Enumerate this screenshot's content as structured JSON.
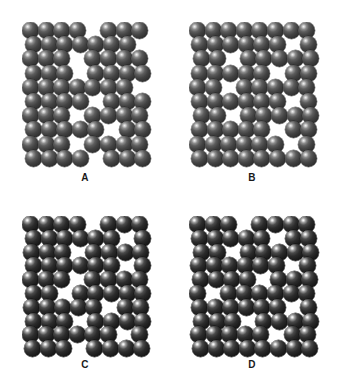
{
  "figure": {
    "background_color": "#ffffff",
    "width": 339,
    "height": 386
  },
  "sphere_style": {
    "gray_body_color": "#434343",
    "gray_shadow_color": "#1d1d1d",
    "dark_body_color": "#2b2b2b",
    "dark_shadow_color": "#0a0a0a",
    "highlight_color": "#ffffff"
  },
  "panels": [
    {
      "id": "panel-a",
      "label": "A",
      "variant": "v-gray",
      "origin_x": 22,
      "origin_y": 22,
      "label_x": 22,
      "label_y": 172,
      "label_width": 126,
      "sphere_diameter": 17,
      "col_step": 15.6,
      "row_step": 14.2,
      "rows": 10,
      "cols": 8,
      "row_offsets": [
        0,
        3,
        0,
        3,
        0,
        3,
        0,
        3,
        0,
        3
      ],
      "vacancies": [
        [
          0,
          4
        ],
        [
          1,
          7
        ],
        [
          2,
          3
        ],
        [
          3,
          3
        ],
        [
          4,
          7
        ],
        [
          5,
          4
        ],
        [
          6,
          3
        ],
        [
          7,
          5
        ],
        [
          8,
          3
        ],
        [
          9,
          4
        ]
      ]
    },
    {
      "id": "panel-b",
      "label": "B",
      "variant": "v-gray",
      "origin_x": 189,
      "origin_y": 22,
      "label_x": 189,
      "label_y": 172,
      "label_width": 126,
      "sphere_diameter": 17,
      "col_step": 15.6,
      "row_step": 14.2,
      "rows": 10,
      "cols": 8,
      "row_offsets": [
        0,
        2,
        4,
        2,
        0,
        2,
        4,
        2,
        0,
        2
      ],
      "vacancies": [
        [
          1,
          6
        ],
        [
          2,
          2
        ],
        [
          3,
          5
        ],
        [
          4,
          2
        ],
        [
          5,
          6
        ],
        [
          6,
          2
        ],
        [
          7,
          5
        ],
        [
          8,
          6
        ]
      ]
    },
    {
      "id": "panel-c",
      "label": "C",
      "variant": "v-dark",
      "origin_x": 22,
      "origin_y": 216,
      "label_x": 22,
      "label_y": 359,
      "label_width": 126,
      "sphere_diameter": 17,
      "col_step": 15.6,
      "row_step": 13.8,
      "rows": 10,
      "cols": 8,
      "row_offsets": [
        0,
        3,
        1,
        3,
        0,
        3,
        1,
        3,
        0,
        2
      ],
      "vacancies": [
        [
          0,
          4
        ],
        [
          1,
          6
        ],
        [
          2,
          3
        ],
        [
          3,
          6
        ],
        [
          4,
          3
        ],
        [
          5,
          2
        ],
        [
          6,
          5
        ],
        [
          7,
          3
        ],
        [
          8,
          6
        ],
        [
          9,
          3
        ]
      ]
    },
    {
      "id": "panel-d",
      "label": "D",
      "variant": "v-dark",
      "origin_x": 189,
      "origin_y": 216,
      "label_x": 189,
      "label_y": 359,
      "label_width": 126,
      "sphere_diameter": 17,
      "col_step": 15.6,
      "row_step": 13.8,
      "rows": 10,
      "cols": 8,
      "row_offsets": [
        0,
        2,
        4,
        1,
        3,
        0,
        2,
        4,
        1,
        3
      ],
      "vacancies": [
        [
          0,
          3
        ],
        [
          1,
          5
        ],
        [
          2,
          2
        ],
        [
          3,
          6
        ],
        [
          4,
          4
        ],
        [
          5,
          1
        ],
        [
          6,
          6
        ],
        [
          7,
          3
        ],
        [
          8,
          5
        ]
      ]
    }
  ]
}
